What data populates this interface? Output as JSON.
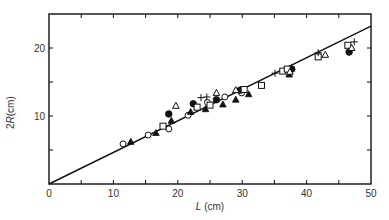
{
  "chart_data": {
    "type": "scatter",
    "title": "",
    "xlabel": "L (cm)",
    "ylabel": "2R(cm)",
    "xlabel_parts": {
      "italic": "L",
      "rest": " (cm)"
    },
    "ylabel_parts": {
      "prefix": "2",
      "italic": "R",
      "rest": "(cm)"
    },
    "xlim": [
      0,
      50
    ],
    "ylim": [
      0,
      25
    ],
    "x_ticks": [
      0,
      10,
      20,
      30,
      40,
      50
    ],
    "y_ticks": [
      10,
      20
    ],
    "y_tick_labels": [
      "10",
      "20"
    ],
    "x_tick_labels": [
      "0",
      "10",
      "20",
      "30",
      "40",
      "50"
    ],
    "minor_tick_step": 5,
    "grid": false,
    "legend": null,
    "fit_line": {
      "x": [
        0,
        50
      ],
      "y": [
        0,
        23.2
      ],
      "style": "solid",
      "color": "#111111"
    },
    "series": [
      {
        "name": "open circle",
        "marker": "circle-open",
        "points": [
          [
            11.5,
            5.9
          ],
          [
            15.4,
            7.2
          ],
          [
            18.6,
            8.1
          ],
          [
            21.6,
            10.1
          ],
          [
            24.6,
            12.0
          ],
          [
            27.3,
            12.8
          ],
          [
            29.9,
            13.4
          ]
        ]
      },
      {
        "name": "filled triangle",
        "marker": "triangle-filled",
        "points": [
          [
            12.7,
            6.2
          ],
          [
            16.6,
            7.5
          ],
          [
            19.0,
            9.3
          ],
          [
            22.0,
            10.6
          ],
          [
            24.3,
            11.0
          ],
          [
            27.0,
            11.7
          ],
          [
            29.0,
            12.4
          ],
          [
            31.0,
            13.2
          ],
          [
            37.3,
            16.1
          ]
        ]
      },
      {
        "name": "filled circle",
        "marker": "circle-filled",
        "points": [
          [
            18.6,
            10.3
          ],
          [
            22.4,
            11.8
          ],
          [
            26.0,
            12.4
          ],
          [
            29.7,
            13.8
          ],
          [
            37.7,
            16.9
          ],
          [
            46.6,
            19.4
          ]
        ]
      },
      {
        "name": "open square",
        "marker": "square-open",
        "points": [
          [
            17.7,
            8.5
          ],
          [
            23.0,
            11.3
          ],
          [
            25.0,
            11.6
          ],
          [
            30.3,
            13.9
          ],
          [
            33.0,
            14.5
          ],
          [
            36.3,
            16.6
          ],
          [
            37.0,
            16.9
          ],
          [
            41.8,
            18.7
          ],
          [
            46.4,
            20.4
          ]
        ]
      },
      {
        "name": "open triangle",
        "marker": "triangle-open",
        "points": [
          [
            19.7,
            11.5
          ],
          [
            26.0,
            13.4
          ],
          [
            29.0,
            13.8
          ],
          [
            37.4,
            16.5
          ],
          [
            42.9,
            19.0
          ],
          [
            47.0,
            20.0
          ]
        ]
      },
      {
        "name": "plus",
        "marker": "plus",
        "points": [
          [
            23.6,
            12.7
          ],
          [
            24.5,
            12.8
          ],
          [
            35.1,
            16.3
          ],
          [
            41.8,
            19.3
          ],
          [
            47.4,
            20.9
          ]
        ]
      }
    ]
  },
  "layout": {
    "plot_left": 49,
    "plot_right": 371,
    "plot_top": 14,
    "plot_bottom": 184,
    "axis_color": "#111111",
    "marker_color": "#111111"
  }
}
